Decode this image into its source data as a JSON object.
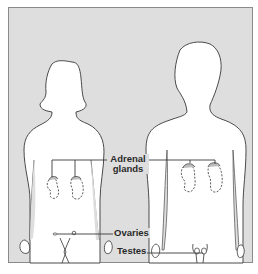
{
  "diagram": {
    "type": "anatomical-diagram",
    "figures": [
      {
        "id": "female",
        "name": "Female body silhouette",
        "position": "left"
      },
      {
        "id": "male",
        "name": "Male body silhouette",
        "position": "right"
      }
    ],
    "labels": {
      "adrenal_line1": "Adrenal",
      "adrenal_line2": "glands",
      "ovaries": "Ovaries",
      "testes": "Testes"
    },
    "colors": {
      "background_panel": "#dedede",
      "frame": "#8a8a8a",
      "body_fill": "#ffffff",
      "outline": "#4a4a4a",
      "label_text": "#2a2a2a"
    }
  }
}
